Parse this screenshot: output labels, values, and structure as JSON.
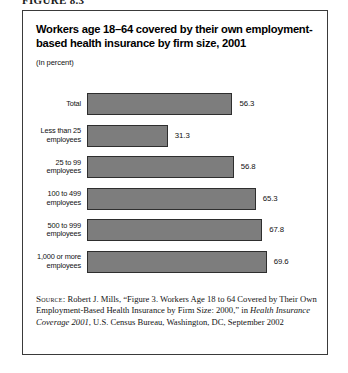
{
  "figure_label": "FIGURE 8.3",
  "chart_data": {
    "type": "bar",
    "orientation": "horizontal",
    "title": "Workers age 18–64 covered by their own employment-based health insurance by firm size, 2001",
    "subtitle": "(In percent)",
    "xlabel": "",
    "ylabel": "",
    "grid": false,
    "legend": "none",
    "xlim": [
      0,
      72
    ],
    "value_suffix": "",
    "categories": [
      "Total",
      "Less than 25 employees",
      "25 to 99 employees",
      "100 to 499 employees",
      "500 to 999 employees",
      "1,000 or more employees"
    ],
    "values": [
      56.3,
      31.3,
      56.8,
      65.3,
      67.8,
      69.6
    ],
    "value_labels": [
      "56.3",
      "31.3",
      "56.8",
      "65.3",
      "67.8",
      "69.6"
    ],
    "bar_color": "#7d7d7d",
    "bar_border_color": "#2e2e2e"
  },
  "source": {
    "kicker": "Source:",
    "text_before_italic": " Robert J. Mills, “Figure 3. Workers Age 18 to 64 Covered by Their Own Employment-Based Health Insurance by Firm Size: 2000,” in ",
    "italic_title": "Health Insurance Coverage 2001",
    "text_after_italic": ", U.S. Census Bureau, Washington, DC, September 2002"
  }
}
